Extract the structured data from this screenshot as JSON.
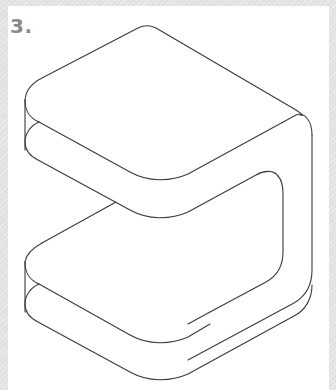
{
  "figure": {
    "label": "3.",
    "colors": {
      "frame": "#e4e4e4",
      "panel": "#ffffff",
      "label": "#8a8a8a",
      "stroke": "#3a3a3a"
    }
  }
}
